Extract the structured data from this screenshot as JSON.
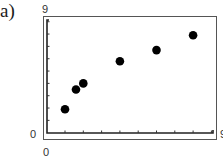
{
  "panel_label": "a)",
  "chart_data": {
    "type": "scatter",
    "title": "",
    "xlabel": "",
    "ylabel": "",
    "xlim": [
      0,
      9
    ],
    "ylim": [
      0,
      9
    ],
    "x_tick_count": 9,
    "y_tick_count": 9,
    "grid": false,
    "legend": null,
    "axis_labels": {
      "y_min": "0",
      "y_max": "9",
      "x_min": "0",
      "x_max": "9"
    },
    "series": [
      {
        "name": "data",
        "marker": "filled-circle",
        "color": "#000000",
        "points": [
          {
            "x": 1.0,
            "y": 1.9
          },
          {
            "x": 1.6,
            "y": 3.5
          },
          {
            "x": 2.0,
            "y": 4.0
          },
          {
            "x": 4.0,
            "y": 5.8
          },
          {
            "x": 6.0,
            "y": 6.7
          },
          {
            "x": 8.0,
            "y": 7.9
          }
        ]
      }
    ]
  }
}
